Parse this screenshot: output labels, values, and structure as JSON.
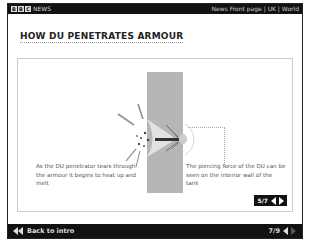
{
  "topbar": {
    "logo_letters": [
      "B",
      "B",
      "C"
    ],
    "brand": "NEWS",
    "links": "News Front page | UK | World"
  },
  "title": "HOW DU PENETRATES ARMOUR",
  "diagram": {
    "caption_left": "As the DU penetrator tears through the armour it begins to heat up and melt",
    "caption_right": "The piercing force of the DU can be seen on the interior wall of the tank",
    "colors": {
      "plate": "#b6b6b6",
      "penetrator": "#333333"
    }
  },
  "slide_pager": {
    "label": "5/7",
    "prev_icon": "triangle-left-icon",
    "next_icon": "triangle-right-icon"
  },
  "bottombar": {
    "back_label": "Back to intro",
    "back_icon": "double-triangle-left-icon",
    "page_label": "7/9"
  }
}
